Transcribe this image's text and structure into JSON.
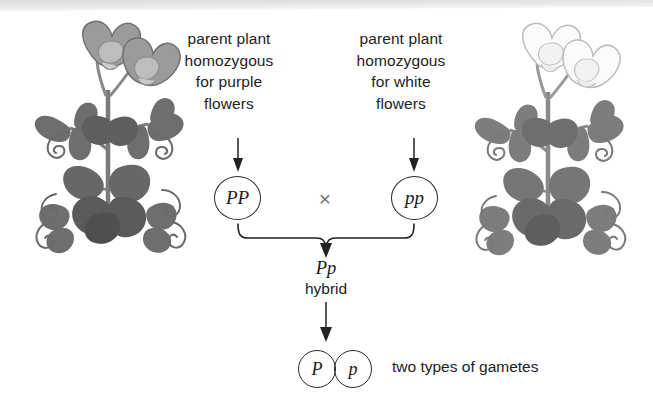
{
  "figure": {
    "background_color": "#ffffff",
    "ink_color": "#1a1a1a"
  },
  "captions": {
    "parent_left": "parent plant\nhomozygous\nfor purple\nflowers",
    "parent_right": "parent plant\nhomozygous\nfor white\nflowers"
  },
  "genotypes": {
    "parent_left": "PP",
    "parent_right": "pp",
    "cross_symbol": "×",
    "hybrid": "Pp",
    "hybrid_label": "hybrid",
    "gamete_dominant": "P",
    "gamete_recessive": "p",
    "gametes_caption": "two types of gametes"
  },
  "plants": [
    {
      "name": "pea-plant-purple",
      "side": "left",
      "flower_color_label": "purple",
      "flower_fill": "#9b9b9b",
      "flower_stroke": "#6e6e6e",
      "leaf_fill": "#6e6e6e",
      "stem_stroke": "#7a7a7a",
      "tendril_stroke": "#6a6a6a"
    },
    {
      "name": "pea-plant-white",
      "side": "right",
      "flower_color_label": "white",
      "flower_fill": "#fbfbfb",
      "flower_stroke": "#bcbcbc",
      "leaf_fill": "#7d7d7d",
      "stem_stroke": "#8a8a8a",
      "tendril_stroke": "#7a7a7a"
    }
  ],
  "connectors": {
    "arrow_left_label": "arrow-to-parent-left-genotype",
    "arrow_right_label": "arrow-to-parent-right-genotype",
    "brace_label": "cross-brace",
    "arrow_hybrid_label": "arrow-to-hybrid",
    "arrow_gametes_label": "arrow-to-gametes"
  },
  "colors": {
    "scan_band": "#d8dadc",
    "cross_symbol": "#6f7174",
    "outline": "#2a2a2a"
  }
}
